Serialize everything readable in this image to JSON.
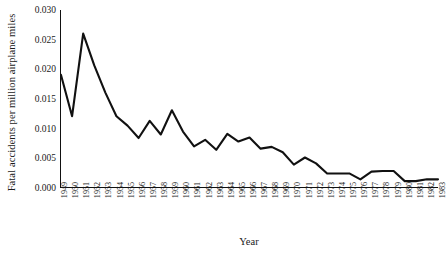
{
  "chart_data": {
    "type": "line",
    "title": "",
    "xlabel": "Year",
    "ylabel": "Fatal accidents per million airplane miles",
    "xlim": [
      1949,
      1983
    ],
    "ylim": [
      0.0,
      0.03
    ],
    "grid": false,
    "legend": null,
    "line_color": "#111111",
    "yticks": [
      "0.000",
      "0.005",
      "0.010",
      "0.015",
      "0.020",
      "0.025",
      "0.030"
    ],
    "ytick_values": [
      0.0,
      0.005,
      0.01,
      0.015,
      0.02,
      0.025,
      0.03
    ],
    "categories": [
      "1949",
      "1950",
      "1951",
      "1952",
      "1953",
      "1954",
      "1955",
      "1956",
      "1957",
      "1958",
      "1959",
      "1960",
      "1961",
      "1962",
      "1963",
      "1964",
      "1965",
      "1966",
      "1967",
      "1968",
      "1969",
      "1970",
      "1971",
      "1972",
      "1973",
      "1974",
      "1975",
      "1976",
      "1977",
      "1978",
      "1979",
      "1980",
      "1981",
      "1982",
      "1983"
    ],
    "values": [
      0.019,
      0.012,
      0.026,
      0.0206,
      0.016,
      0.012,
      0.0104,
      0.0083,
      0.0112,
      0.0089,
      0.013,
      0.0094,
      0.0069,
      0.008,
      0.0063,
      0.009,
      0.0077,
      0.0084,
      0.0065,
      0.0068,
      0.0059,
      0.0038,
      0.005,
      0.004,
      0.0023,
      0.0023,
      0.0023,
      0.0013,
      0.0026,
      0.0027,
      0.0027,
      0.001,
      0.001,
      0.0013,
      0.0013
    ]
  }
}
